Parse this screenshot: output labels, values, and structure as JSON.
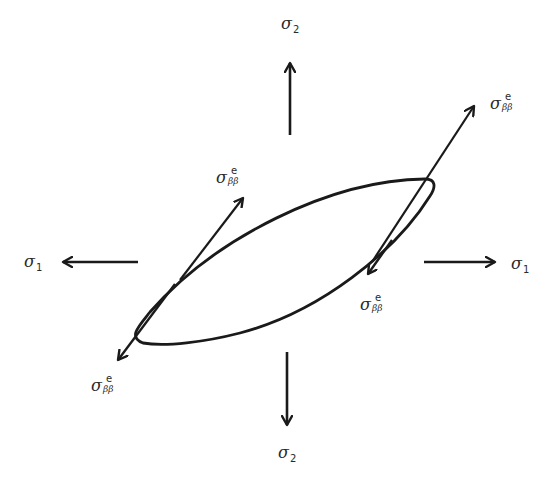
{
  "figure": {
    "type": "stress-diagram",
    "stroke_color": "#1a1a1a",
    "labels": {
      "sigma2_top": {
        "symbol": "σ",
        "subscript": "2"
      },
      "sigma2_bottom": {
        "symbol": "σ",
        "subscript": "2"
      },
      "sigma1_left": {
        "symbol": "σ",
        "subscript": "1"
      },
      "sigma1_right": {
        "symbol": "σ",
        "subscript": "1"
      },
      "sigma_bb_upper_right": {
        "symbol": "σ",
        "superscript": "e",
        "subscript": "ββ"
      },
      "sigma_bb_upper_left": {
        "symbol": "σ",
        "superscript": "e",
        "subscript": "ββ"
      },
      "sigma_bb_lower_right": {
        "symbol": "σ",
        "superscript": "e",
        "subscript": "ββ"
      },
      "sigma_bb_lower_left": {
        "symbol": "σ",
        "superscript": "e",
        "subscript": "ββ"
      }
    },
    "arrows": [
      {
        "name": "sigma2-up-arrow",
        "direction": "up"
      },
      {
        "name": "sigma2-down-arrow",
        "direction": "down"
      },
      {
        "name": "sigma1-left-arrow",
        "direction": "left"
      },
      {
        "name": "sigma1-right-arrow",
        "direction": "right"
      },
      {
        "name": "sigma-bb-upper-right-arrow",
        "direction": "up-right"
      },
      {
        "name": "sigma-bb-upper-left-arrow",
        "direction": "up-right"
      },
      {
        "name": "sigma-bb-lower-right-arrow",
        "direction": "down-left"
      },
      {
        "name": "sigma-bb-lower-left-arrow",
        "direction": "down-left"
      }
    ]
  }
}
